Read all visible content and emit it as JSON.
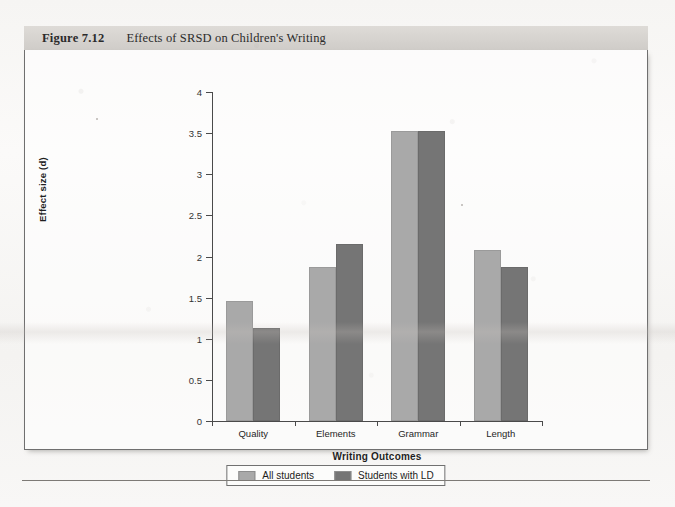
{
  "figure": {
    "label": "Figure 7.12",
    "title": "Effects of SRSD on Children's Writing"
  },
  "chart_data": {
    "type": "bar",
    "title": "Effects of SRSD on Children's Writing",
    "xlabel": "Writing Outcomes",
    "ylabel": "Effect size (d)",
    "categories": [
      "Quality",
      "Elements",
      "Grammar",
      "Length"
    ],
    "series": [
      {
        "name": "All students",
        "color": "#a9a9a9",
        "values": [
          1.46,
          1.87,
          3.52,
          2.08
        ]
      },
      {
        "name": "Students with LD",
        "color": "#757575",
        "values": [
          1.13,
          2.15,
          3.52,
          1.87
        ]
      }
    ],
    "ylim": [
      0,
      4
    ],
    "yticks": [
      "0",
      "0.5",
      "1",
      "1.5",
      "2",
      "2.5",
      "3",
      "3.5",
      "4"
    ],
    "ytick_values": [
      0,
      0.5,
      1,
      1.5,
      2,
      2.5,
      3,
      3.5,
      4
    ],
    "grid": false,
    "legend_position": "bottom"
  },
  "legend": {
    "entries": [
      {
        "label": "All students"
      },
      {
        "label": "Students with LD"
      }
    ]
  }
}
